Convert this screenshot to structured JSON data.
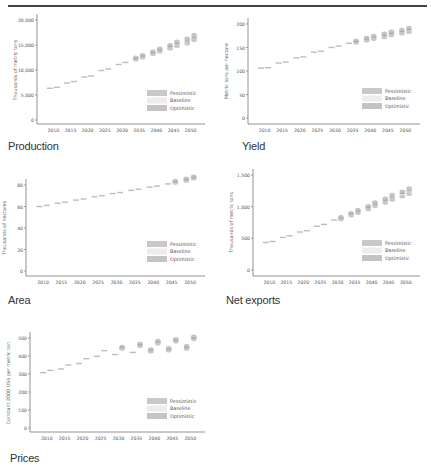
{
  "page": {
    "top_rule": true
  },
  "legend": {
    "items": [
      {
        "label": "Pessimistic",
        "color": "#c8c8c8"
      },
      {
        "label": "Baseline",
        "color": "#ececec"
      },
      {
        "label": "Optimistic",
        "color": "#c4c4c4"
      }
    ]
  },
  "chart_data": [
    {
      "id": "production",
      "type": "scatter",
      "title": "Production",
      "xlabel": "",
      "ylabel": "Thousands of metric tons",
      "x_ticks": [
        "2010",
        "2015",
        "2020",
        "2025",
        "2030",
        "2035",
        "2040",
        "2045",
        "2050"
      ],
      "y_ticks": [
        "0",
        "5,000",
        "10,000",
        "15,000",
        "20,000"
      ],
      "ylim": [
        0,
        20000
      ],
      "xlim": [
        2007,
        2053
      ],
      "grid": false,
      "legend_position": "lower right",
      "x": [
        2009,
        2011,
        2014,
        2016,
        2019,
        2021,
        2024,
        2026,
        2029,
        2031,
        2034,
        2036,
        2039,
        2041,
        2044,
        2046,
        2049,
        2051
      ],
      "series": [
        {
          "name": "Pessimistic",
          "values": [
            6300,
            6500,
            7300,
            7600,
            8500,
            8700,
            9800,
            10100,
            11000,
            11300,
            12100,
            12500,
            13200,
            13700,
            14300,
            14800,
            15300,
            16000
          ]
        },
        {
          "name": "Baseline",
          "values": [
            6350,
            6550,
            7400,
            7700,
            8600,
            8800,
            9900,
            10200,
            11100,
            11500,
            12300,
            12800,
            13500,
            14000,
            14700,
            15300,
            15800,
            16500
          ]
        },
        {
          "name": "Optimistic",
          "values": [
            6400,
            6600,
            7450,
            7750,
            8650,
            8900,
            10000,
            10300,
            11200,
            11600,
            12500,
            13000,
            13700,
            14300,
            15000,
            15700,
            16300,
            17000
          ]
        }
      ]
    },
    {
      "id": "yield",
      "type": "scatter",
      "title": "Yield",
      "xlabel": "",
      "ylabel": "Metric tons per hectare",
      "x_ticks": [
        "2010",
        "2015",
        "2020",
        "2025",
        "2030",
        "2035",
        "2040",
        "2045",
        "2050"
      ],
      "y_ticks": [
        "0",
        "50",
        "100",
        "150",
        "200"
      ],
      "ylim": [
        0,
        200
      ],
      "xlim": [
        2007,
        2053
      ],
      "grid": false,
      "legend_position": "lower right",
      "x": [
        2009,
        2011,
        2014,
        2016,
        2019,
        2021,
        2024,
        2026,
        2029,
        2031,
        2034,
        2036,
        2039,
        2041,
        2044,
        2046,
        2049,
        2051
      ],
      "series": [
        {
          "name": "Pessimistic",
          "values": [
            105,
            106,
            116,
            118,
            127,
            129,
            139,
            141,
            149,
            151,
            157,
            160,
            165,
            168,
            172,
            176,
            180,
            183
          ]
        },
        {
          "name": "Baseline",
          "values": [
            106,
            107,
            117,
            119,
            128,
            130,
            140,
            142,
            150,
            153,
            159,
            163,
            168,
            172,
            176,
            180,
            184,
            188
          ]
        },
        {
          "name": "Optimistic",
          "values": [
            106,
            107,
            118,
            120,
            129,
            131,
            141,
            143,
            151,
            154,
            161,
            165,
            171,
            175,
            180,
            184,
            188,
            192
          ]
        }
      ]
    },
    {
      "id": "area",
      "type": "scatter",
      "title": "Area",
      "xlabel": "",
      "ylabel": "Thousands of hectares",
      "x_ticks": [
        "2010",
        "2015",
        "2020",
        "2025",
        "2030",
        "2035",
        "2040",
        "2045",
        "2050"
      ],
      "y_ticks": [
        "0",
        "20",
        "40",
        "60",
        "80"
      ],
      "ylim": [
        0,
        90
      ],
      "xlim": [
        2007,
        2053
      ],
      "grid": false,
      "legend_position": "lower right",
      "x": [
        2009,
        2011,
        2014,
        2016,
        2019,
        2021,
        2024,
        2026,
        2029,
        2031,
        2034,
        2036,
        2039,
        2041,
        2044,
        2046,
        2049,
        2051
      ],
      "series": [
        {
          "name": "Pessimistic",
          "values": [
            60,
            61,
            63,
            64,
            66,
            67,
            69,
            70,
            72,
            73,
            75,
            76,
            78,
            79,
            81,
            82,
            84,
            86
          ]
        },
        {
          "name": "Baseline",
          "values": [
            60,
            61,
            63,
            64,
            66,
            67,
            69,
            70,
            72,
            73,
            75,
            76,
            78,
            79,
            81,
            83,
            85,
            87
          ]
        },
        {
          "name": "Optimistic",
          "values": [
            60,
            61,
            63,
            64,
            66,
            67,
            69,
            70,
            72,
            73,
            75,
            77,
            79,
            80,
            82,
            84,
            86,
            88
          ]
        }
      ]
    },
    {
      "id": "net_exports",
      "type": "scatter",
      "title": "Net exports",
      "xlabel": "",
      "ylabel": "Thousands of metric tons",
      "x_ticks": [
        "2010",
        "2015",
        "2020",
        "2025",
        "2030",
        "2035",
        "2040",
        "2045",
        "2050"
      ],
      "y_ticks": [
        "0",
        "500",
        "1,000",
        "1,500"
      ],
      "ylim": [
        0,
        1500
      ],
      "xlim": [
        2007,
        2053
      ],
      "grid": false,
      "legend_position": "lower right",
      "x": [
        2009,
        2011,
        2014,
        2016,
        2019,
        2021,
        2024,
        2026,
        2029,
        2031,
        2034,
        2036,
        2039,
        2041,
        2044,
        2046,
        2049,
        2051
      ],
      "series": [
        {
          "name": "Pessimistic",
          "values": [
            430,
            445,
            510,
            530,
            590,
            610,
            670,
            700,
            770,
            800,
            860,
            900,
            960,
            1010,
            1060,
            1110,
            1160,
            1200
          ]
        },
        {
          "name": "Baseline",
          "values": [
            435,
            450,
            515,
            540,
            600,
            620,
            690,
            720,
            790,
            820,
            890,
            930,
            990,
            1040,
            1100,
            1150,
            1210,
            1250
          ]
        },
        {
          "name": "Optimistic",
          "values": [
            440,
            455,
            520,
            545,
            610,
            630,
            700,
            730,
            800,
            835,
            900,
            950,
            1010,
            1070,
            1130,
            1190,
            1240,
            1290
          ]
        }
      ]
    },
    {
      "id": "prices",
      "type": "scatter",
      "title": "Prices",
      "xlabel": "",
      "ylabel": "Constant 2000 US$ per metric ton",
      "x_ticks": [
        "2010",
        "2015",
        "2020",
        "2025",
        "2030",
        "2035",
        "2040",
        "2045",
        "2050"
      ],
      "y_ticks": [
        "0",
        "100",
        "200",
        "300",
        "400",
        "500"
      ],
      "ylim": [
        0,
        550
      ],
      "xlim": [
        2007,
        2053
      ],
      "grid": false,
      "legend_position": "lower right",
      "x": [
        2009,
        2011,
        2014,
        2016,
        2019,
        2021,
        2024,
        2026,
        2029,
        2031,
        2034,
        2036,
        2039,
        2041,
        2044,
        2046,
        2049,
        2051
      ],
      "series": [
        {
          "name": "Pessimistic",
          "values": [
            305,
            318,
            325,
            348,
            355,
            382,
            395,
            425,
            405,
            440,
            415,
            455,
            425,
            470,
            430,
            480,
            440,
            495
          ]
        },
        {
          "name": "Baseline",
          "values": [
            308,
            320,
            328,
            350,
            358,
            385,
            398,
            430,
            408,
            448,
            420,
            462,
            432,
            478,
            438,
            488,
            448,
            500
          ]
        },
        {
          "name": "Optimistic",
          "values": [
            310,
            322,
            330,
            352,
            360,
            388,
            400,
            435,
            412,
            452,
            425,
            468,
            438,
            485,
            445,
            495,
            455,
            508
          ]
        }
      ]
    }
  ]
}
